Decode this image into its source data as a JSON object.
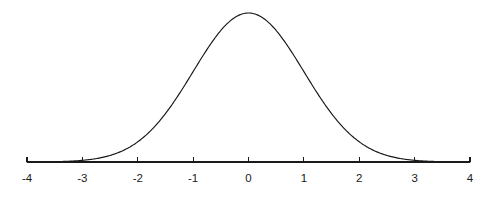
{
  "chart_data": {
    "type": "line",
    "title": "",
    "subtitle": "",
    "xlabel": "",
    "ylabel": "",
    "grid": false,
    "legend": null,
    "curve_name": "standard normal density",
    "distribution": {
      "mean": 0,
      "sd": 1,
      "formula": "y = exp(-x^2 / 2) / sqrt(2*pi)"
    },
    "xlim": [
      -4,
      4
    ],
    "ylim": [
      0,
      0.3989
    ],
    "x_ticks": [
      -4,
      -3,
      -2,
      -1,
      0,
      1,
      2,
      3,
      4
    ],
    "x_tick_labels": [
      "-4",
      "-3",
      "-2",
      "-1",
      "0",
      "1",
      "2",
      "3",
      "4"
    ],
    "y_ticks": [],
    "y_tick_labels": [],
    "x": [
      -4,
      -3.75,
      -3.5,
      -3.25,
      -3,
      -2.75,
      -2.5,
      -2.25,
      -2,
      -1.75,
      -1.5,
      -1.25,
      -1,
      -0.75,
      -0.5,
      -0.25,
      0,
      0.25,
      0.5,
      0.75,
      1,
      1.25,
      1.5,
      1.75,
      2,
      2.25,
      2.5,
      2.75,
      3,
      3.25,
      3.5,
      3.75,
      4
    ],
    "values": [
      0.0001,
      0.0004,
      0.0009,
      0.002,
      0.0044,
      0.0091,
      0.0175,
      0.0317,
      0.054,
      0.0863,
      0.1295,
      0.1826,
      0.242,
      0.3011,
      0.3521,
      0.3867,
      0.3989,
      0.3867,
      0.3521,
      0.3011,
      0.242,
      0.1826,
      0.1295,
      0.0863,
      0.054,
      0.0317,
      0.0175,
      0.0091,
      0.0044,
      0.002,
      0.0009,
      0.0004,
      0.0001
    ],
    "colors": {
      "curve": "#171717",
      "axis": "#1a1a1a",
      "background": "#ffffff",
      "tick_label": "#1a1a1a"
    }
  },
  "geometry": {
    "axis_y": 162,
    "peak_y": 13,
    "x_left_px": 27,
    "x_right_px": 470,
    "tick_length": 5
  }
}
